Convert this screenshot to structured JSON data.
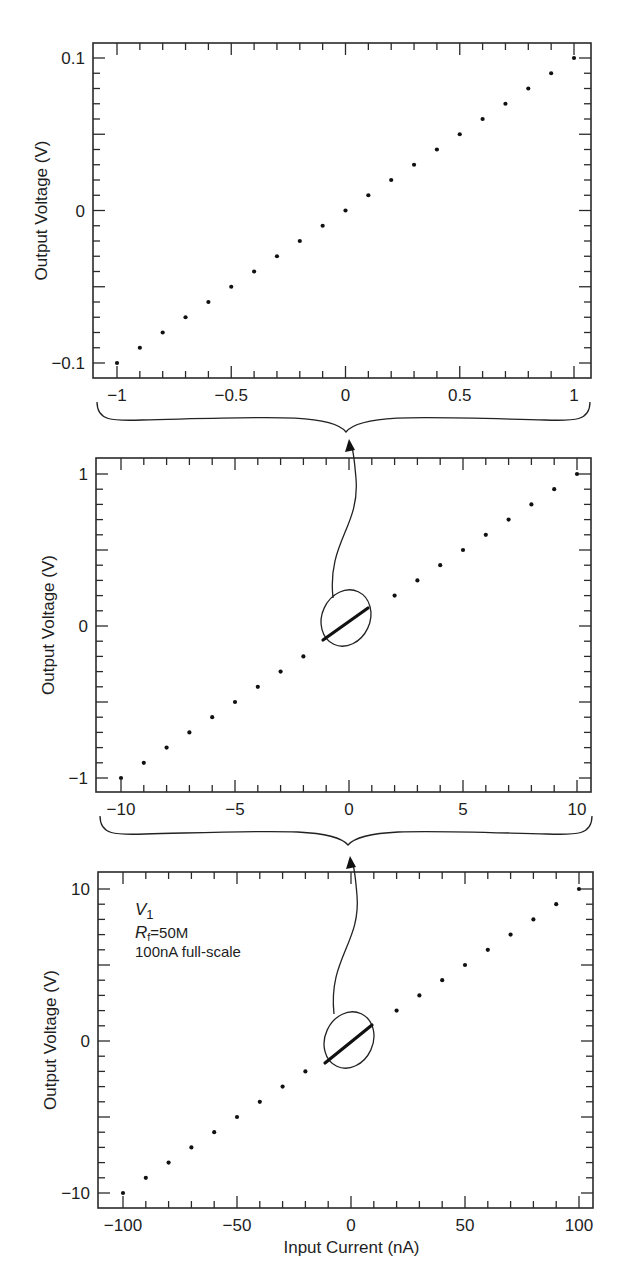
{
  "figure": {
    "width": 633,
    "height": 1283,
    "ink_color": "#1e1e1e",
    "background": "#ffffff"
  },
  "chart_data": [
    {
      "type": "scatter",
      "id": "panel-top",
      "title": "",
      "xlabel": "",
      "ylabel": "Output Voltage (V)",
      "xlim": [
        -1.1,
        1.1
      ],
      "ylim": [
        -0.11,
        0.11
      ],
      "grid": false,
      "legend": null,
      "x_ticks_major": [
        -1,
        -0.5,
        0,
        0.5,
        1
      ],
      "x_tick_labels": [
        "−1",
        "−0.5",
        "0",
        "0.5",
        "1"
      ],
      "x_minor_step": 0.1,
      "y_ticks_major": [
        -0.1,
        -0.05,
        0,
        0.05,
        0.1
      ],
      "y_tick_labels": [
        "−0.1",
        "",
        "0",
        "",
        "0.1"
      ],
      "y_minor_step": 0.01,
      "x": [
        -1.0,
        -0.9,
        -0.8,
        -0.7,
        -0.6,
        -0.5,
        -0.4,
        -0.3,
        -0.2,
        -0.1,
        0.0,
        0.1,
        0.2,
        0.3,
        0.4,
        0.5,
        0.6,
        0.7,
        0.8,
        0.9,
        1.0
      ],
      "y": [
        -0.1,
        -0.09,
        -0.08,
        -0.07,
        -0.06,
        -0.05,
        -0.04,
        -0.03,
        -0.02,
        -0.01,
        0.0,
        0.01,
        0.02,
        0.03,
        0.04,
        0.05,
        0.06,
        0.07,
        0.08,
        0.09,
        0.1
      ],
      "layout": {
        "left": 93,
        "right": 591,
        "top": 43,
        "bottom": 378,
        "x0_px": 117,
        "x1_px": 574,
        "y0_px": 363,
        "y1_px": 58
      }
    },
    {
      "type": "scatter",
      "id": "panel-middle",
      "title": "",
      "xlabel": "",
      "ylabel": "Output Voltage (V)",
      "xlim": [
        -11,
        11
      ],
      "ylim": [
        -1.1,
        1.1
      ],
      "grid": false,
      "legend": null,
      "x_ticks_major": [
        -10,
        -5,
        0,
        5,
        10
      ],
      "x_tick_labels": [
        "−10",
        "−5",
        "0",
        "5",
        "10"
      ],
      "x_minor_step": 1,
      "y_ticks_major": [
        -1,
        -0.5,
        0,
        0.5,
        1
      ],
      "y_tick_labels": [
        "−1",
        "",
        "0",
        "",
        "1"
      ],
      "y_minor_step": 0.1,
      "x": [
        -10,
        -9,
        -8,
        -7,
        -6,
        -5,
        -4,
        -3,
        -2,
        2,
        3,
        4,
        5,
        6,
        7,
        8,
        9,
        10
      ],
      "y": [
        -1.0,
        -0.9,
        -0.8,
        -0.7,
        -0.6,
        -0.5,
        -0.4,
        -0.3,
        -0.2,
        0.2,
        0.3,
        0.4,
        0.5,
        0.6,
        0.7,
        0.8,
        0.9,
        1.0
      ],
      "inset_note": "Points from -1 to 1 nA shown magnified as circled segment (top panel)",
      "layout": {
        "left": 96,
        "right": 591,
        "top": 458,
        "bottom": 792,
        "x0_px": 121,
        "x1_px": 577,
        "y0_px": 778,
        "y1_px": 474
      }
    },
    {
      "type": "scatter",
      "id": "panel-bottom",
      "title": "",
      "xlabel": "Input Current (nA)",
      "ylabel": "Output Voltage (V)",
      "xlim": [
        -110,
        110
      ],
      "ylim": [
        -11,
        11
      ],
      "grid": false,
      "legend": null,
      "x_ticks_major": [
        -100,
        -50,
        0,
        50,
        100
      ],
      "x_tick_labels": [
        "−100",
        "−50",
        "0",
        "50",
        "100"
      ],
      "x_minor_step": 10,
      "y_ticks_major": [
        -10,
        -5,
        0,
        5,
        10
      ],
      "y_tick_labels": [
        "−10",
        "",
        "0",
        "",
        "10"
      ],
      "y_minor_step": 1,
      "x": [
        -100,
        -90,
        -80,
        -70,
        -60,
        -50,
        -40,
        -30,
        -20,
        20,
        30,
        40,
        50,
        60,
        70,
        80,
        90,
        100
      ],
      "y": [
        -10,
        -9,
        -8,
        -7,
        -6,
        -5,
        -4,
        -3,
        -2,
        2,
        3,
        4,
        5,
        6,
        7,
        8,
        9,
        10
      ],
      "annotations": [
        "V1",
        "Rf=50M",
        "100nA full-scale"
      ],
      "inset_note": "Points from -10 to 10 nA shown magnified as circled segment (middle panel)",
      "layout": {
        "left": 98,
        "right": 593,
        "top": 872,
        "bottom": 1208,
        "x0_px": 123,
        "x1_px": 579,
        "y0_px": 1193,
        "y1_px": 889
      }
    }
  ],
  "annotation": {
    "var_symbol": "V",
    "var_subscript": "1",
    "rf_symbol": "R",
    "rf_subscript": "f",
    "rf_value": "=50M",
    "fullscale": "100nA full-scale"
  },
  "labels": {
    "ylabel": "Output Voltage (V)",
    "xlabel_bottom": "Input Current (nA)"
  },
  "zoom_links": [
    {
      "from_panel": "panel-middle",
      "to_panel": "panel-top",
      "ellipse": {
        "cx": 346,
        "cy": 618,
        "rx": 24,
        "ry": 29,
        "rot": 25
      },
      "segment": [
        323,
        640,
        368,
        608
      ],
      "brace_y": 402,
      "brace_left": 97,
      "brace_right": 590,
      "cusp": [
        346,
        432
      ],
      "arrow_start": [
        333,
        598
      ],
      "arrow_tip": [
        350,
        439
      ]
    },
    {
      "from_panel": "panel-bottom",
      "to_panel": "panel-middle",
      "ellipse": {
        "cx": 349,
        "cy": 1040,
        "rx": 24,
        "ry": 29,
        "rot": 25
      },
      "segment": [
        325,
        1063,
        372,
        1025
      ],
      "brace_y": 816,
      "brace_left": 100,
      "brace_right": 592,
      "cusp": [
        348,
        845
      ],
      "arrow_start": [
        334,
        1014
      ],
      "arrow_tip": [
        351,
        856
      ]
    }
  ]
}
